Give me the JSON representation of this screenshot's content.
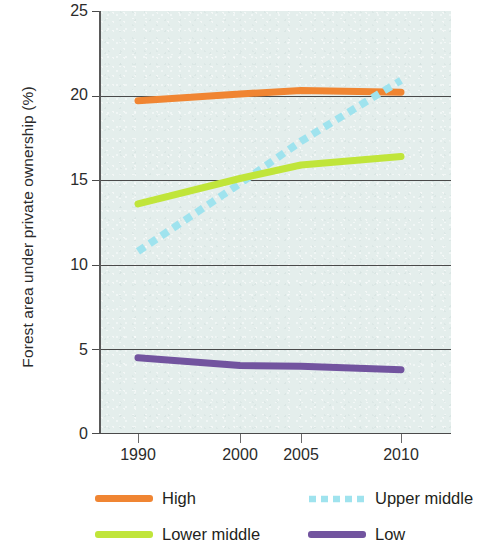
{
  "chart_data": {
    "type": "line",
    "title": "",
    "xlabel": "",
    "ylabel": "Forest area under private ownership (%)",
    "x": [
      1990,
      2000,
      2005,
      2010
    ],
    "xtick_labels": [
      "1990",
      "2000",
      "2005",
      "2010"
    ],
    "ytick_labels": [
      "25",
      "20",
      "15",
      "10",
      "5",
      "0"
    ],
    "ylim": [
      0,
      25
    ],
    "yticks": [
      0,
      5,
      10,
      15,
      20,
      25
    ],
    "grid": "horizontal",
    "legend_position": "bottom",
    "series": [
      {
        "name": "High",
        "values": [
          19.7,
          20.1,
          20.3,
          20.2
        ],
        "color": "#f08532",
        "style": "solid"
      },
      {
        "name": "Upper middle",
        "values": [
          10.8,
          14.8,
          17.3,
          20.9
        ],
        "color": "#9fe3ee",
        "style": "dashed"
      },
      {
        "name": "Lower middle",
        "values": [
          13.6,
          15.1,
          15.9,
          16.4
        ],
        "color": "#c0e53a",
        "style": "solid"
      },
      {
        "name": "Low",
        "values": [
          4.5,
          4.05,
          4.0,
          3.8
        ],
        "color": "#72549f",
        "style": "solid"
      }
    ]
  },
  "axis": {
    "y_title": "Forest area under private ownership (%)",
    "y_ticks": [
      "25",
      "20",
      "15",
      "10",
      "5",
      "0"
    ],
    "x_ticks": [
      "1990",
      "2000",
      "2005",
      "2010"
    ]
  },
  "legend": {
    "items": [
      {
        "label": "High",
        "color": "#f08532",
        "style": "solid"
      },
      {
        "label": "Upper middle",
        "color": "#9fe3ee",
        "style": "dashed"
      },
      {
        "label": "Lower middle",
        "color": "#c0e53a",
        "style": "solid"
      },
      {
        "label": "Low",
        "color": "#72549f",
        "style": "solid"
      }
    ]
  }
}
